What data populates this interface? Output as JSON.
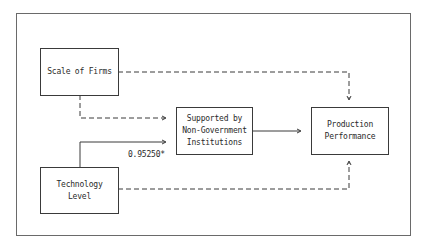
{
  "diagram": {
    "nodes": [
      {
        "id": "scale",
        "label": "Scale of Firms"
      },
      {
        "id": "tech",
        "label": "Technology\nLevel"
      },
      {
        "id": "support",
        "label": "Supported by\nNon-Government\nInstitutions"
      },
      {
        "id": "prod",
        "label": "Production\nPerformance"
      }
    ],
    "edges": [
      {
        "from": "scale",
        "to": "support",
        "style": "dashed"
      },
      {
        "from": "scale",
        "to": "prod",
        "style": "dashed"
      },
      {
        "from": "tech",
        "to": "support",
        "style": "solid",
        "label": "0.95250*"
      },
      {
        "from": "tech",
        "to": "prod",
        "style": "dashed"
      },
      {
        "from": "support",
        "to": "prod",
        "style": "solid"
      }
    ],
    "colors": {
      "line": "#3a3a3a",
      "frame": "#6a6a6a",
      "background": "#ffffff"
    }
  }
}
